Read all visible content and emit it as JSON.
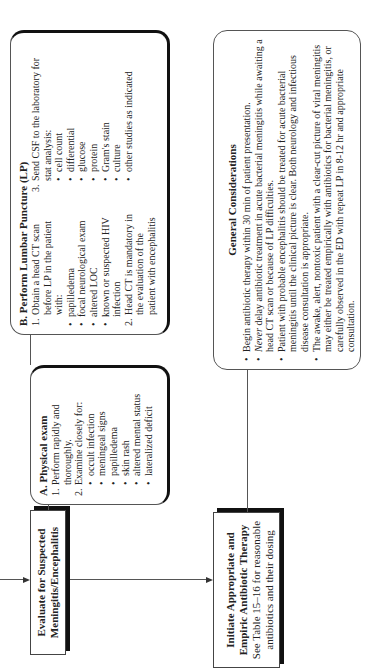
{
  "flow": {
    "evaluate": {
      "title_line1": "Evaluate for Suspected",
      "title_line2": "Meningitis/Encephalitis"
    },
    "initiate": {
      "title_line1": "Initiate Appropriate and",
      "title_line2": "Empiric Antibiotic Therapy",
      "note_line1": "See Table 15–16 for reasonable",
      "note_line2": "antibiotics and their dosing"
    }
  },
  "box_a": {
    "title": "A.  Physical exam",
    "items": [
      {
        "num": "1.",
        "text": "Perform rapidly and thoroughly."
      },
      {
        "num": "2.",
        "text": "Examine closely for:"
      }
    ],
    "bullets": [
      "occult infection",
      "meningeal signs",
      "papilledema",
      "skin rash",
      "altered mental status",
      "lateralized deficit"
    ]
  },
  "box_b": {
    "title": "B.  Perform Lumbar Puncture (LP)",
    "item1": {
      "num": "1.",
      "text": "Obtain a head CT scan before LP in the patient with:"
    },
    "item1_bullets": [
      "papilledema",
      "focal neurological exam",
      "altered LOC",
      "known or suspected HIV infection"
    ],
    "item2": {
      "num": "2.",
      "text": "Head CT is mandatory in the evaluation of the patient with encephalitis"
    },
    "item3": {
      "num": "3.",
      "text": "Send CSF to the laboratory for stat analysis:"
    },
    "item3_bullets": [
      "cell count",
      "differential",
      "glucose",
      "protein",
      "Gram's stain",
      "culture",
      "other studies as indicated"
    ]
  },
  "general": {
    "title": "General Considerations",
    "bullets": [
      {
        "pre": "",
        "em": "",
        "text": "Begin antibiotic therapy within 30 min of patient presentation."
      },
      {
        "pre": "",
        "em": "Never",
        "text": " delay antibiotic treatment in acute bacterial meningitis while awaiting a head CT scan or because of LP difficulties."
      },
      {
        "pre": "",
        "em": "",
        "text": "Patient with probable encephalitis should be treated for acute bacterial meningitis until the clinical picture is clear. Both neurology and infectious disease consultation is appropriate."
      },
      {
        "pre": "",
        "em": "",
        "text": "The awake, alert, nontoxic patient with a clear-cut picture of viral meningitis may either be treated empirically with antibiotics for bacterial meningitis, or carefully observed in the ED with repeat LP in 8-12 hr and appropriate consultation."
      }
    ]
  },
  "colors": {
    "line": "#555555",
    "shadow": "#111111",
    "text": "#222222",
    "background": "#ffffff"
  }
}
